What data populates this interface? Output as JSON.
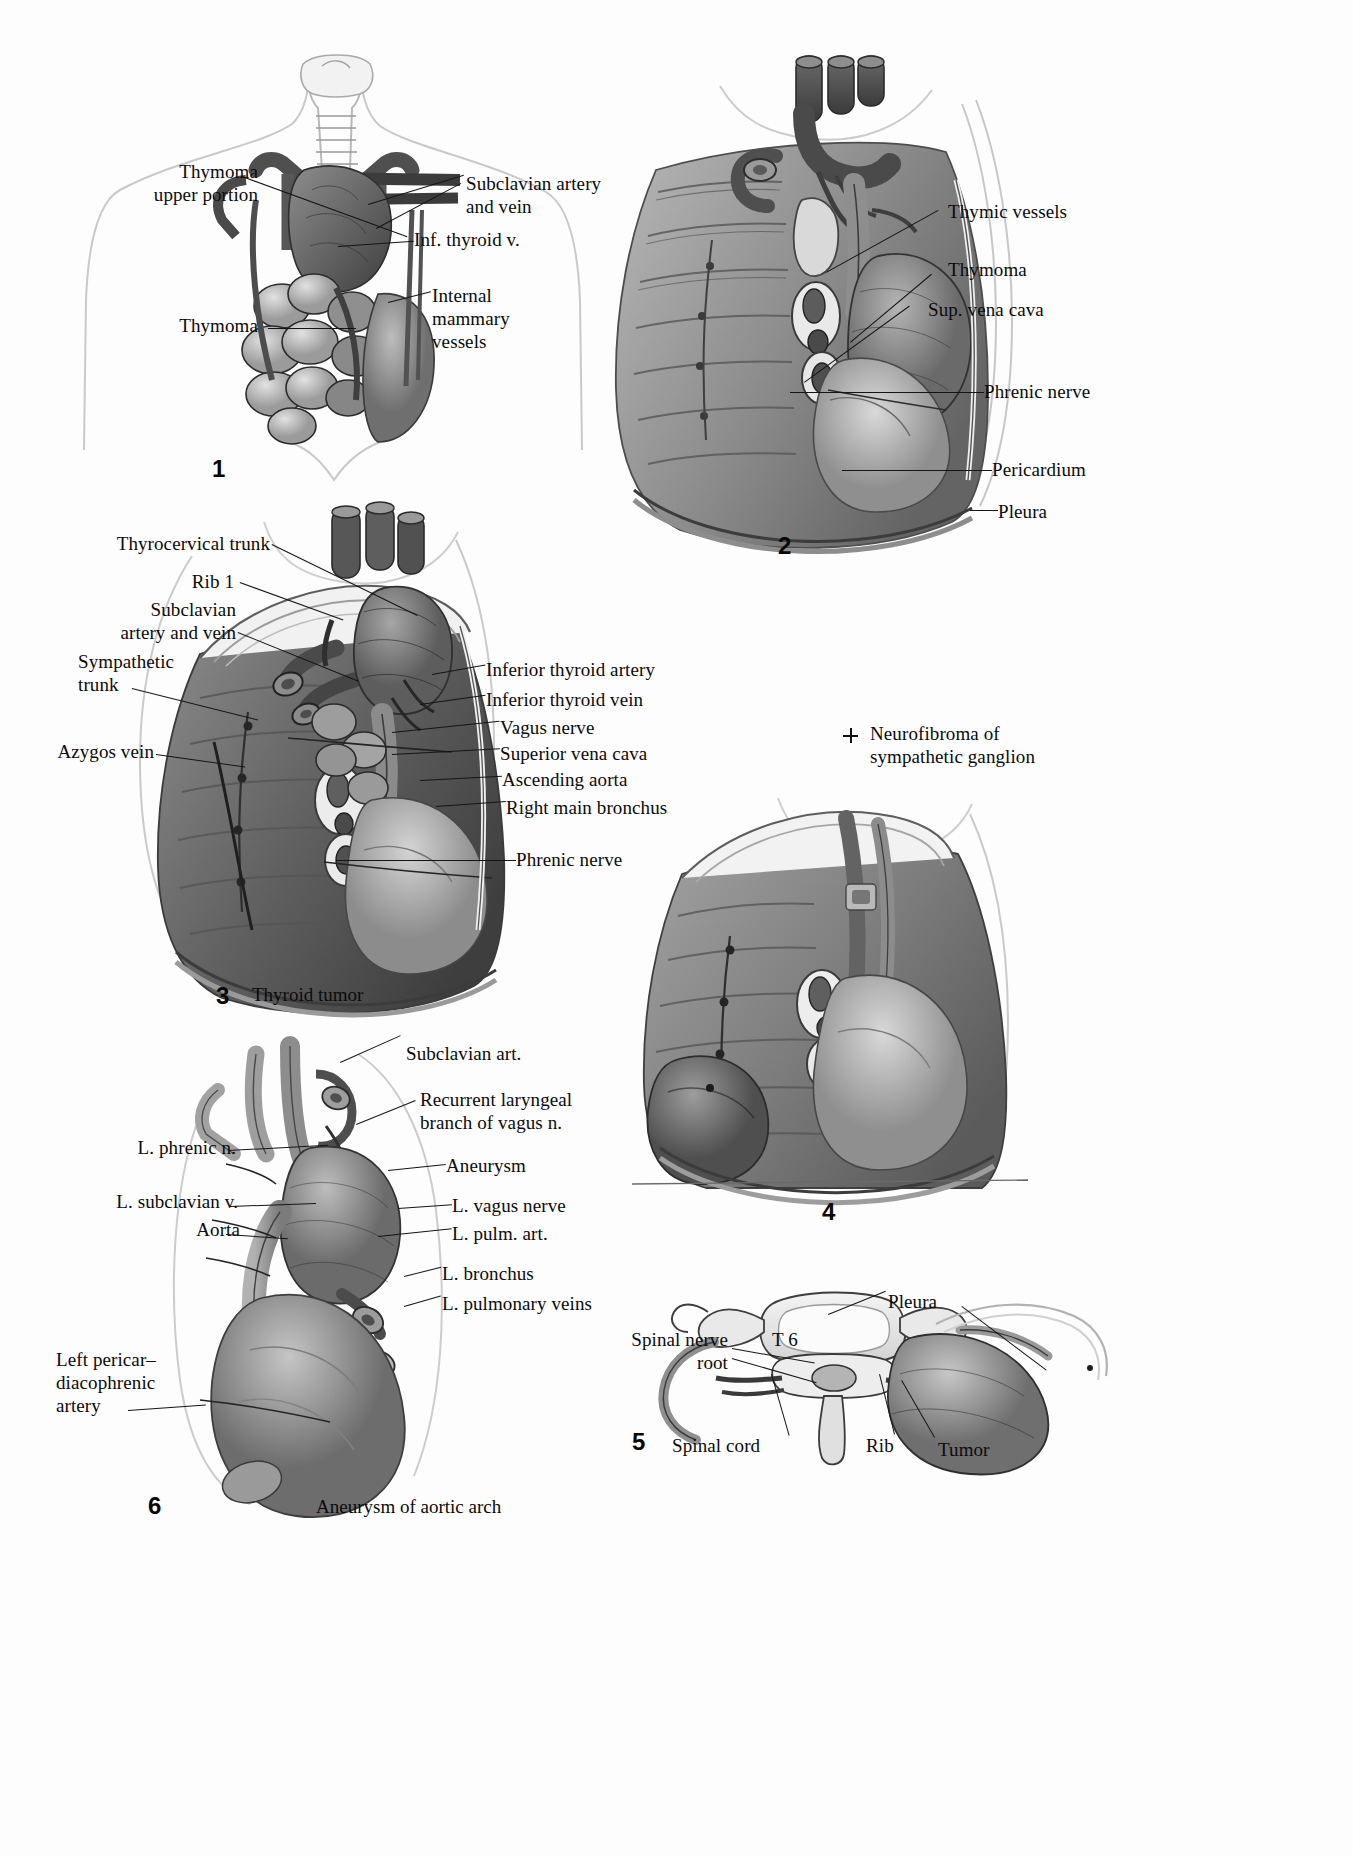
{
  "page": {
    "kind": "anatomical-plate",
    "background": "#fdfdfd",
    "ink": "#111111"
  },
  "figures": [
    {
      "id": "fig1",
      "number": "1",
      "title_caption": "",
      "labels": [
        {
          "name": "thymoma-upper-portion",
          "text": "Thymoma\nupper portion"
        },
        {
          "name": "thymoma",
          "text": "Thymoma"
        },
        {
          "name": "subclavian-artery-and-vein",
          "text": "Subclavian artery and vein"
        },
        {
          "name": "inf-thyroid-v",
          "text": "Inf. thyroid v."
        },
        {
          "name": "internal-mammary-vessels",
          "text": "Internal\nmammary\nvessels"
        }
      ]
    },
    {
      "id": "fig2",
      "number": "2",
      "title_caption": "",
      "labels": [
        {
          "name": "thymic-vessels",
          "text": "Thymic vessels"
        },
        {
          "name": "thymoma",
          "text": "Thymoma"
        },
        {
          "name": "sup-vena-cava",
          "text": "Sup. vena cava"
        },
        {
          "name": "phrenic-nerve",
          "text": "Phrenic nerve"
        },
        {
          "name": "pericardium",
          "text": "Pericardium"
        },
        {
          "name": "pleura",
          "text": "Pleura"
        }
      ]
    },
    {
      "id": "fig3",
      "number": "3",
      "title_caption": "Thyroid tumor",
      "labels": [
        {
          "name": "thyrocervical-trunk",
          "text": "Thyrocervical trunk"
        },
        {
          "name": "rib-1",
          "text": "Rib 1"
        },
        {
          "name": "subclavian-artery-and-vein",
          "text": "Subclavian\nartery and vein"
        },
        {
          "name": "sympathetic-trunk",
          "text": "Sympathetic\ntrunk"
        },
        {
          "name": "azygos-vein",
          "text": "Azygos vein"
        },
        {
          "name": "inferior-thyroid-artery",
          "text": "Inferior thyroid artery"
        },
        {
          "name": "inferior-thyroid-vein",
          "text": "Inferior thyroid vein"
        },
        {
          "name": "vagus-nerve",
          "text": "Vagus nerve"
        },
        {
          "name": "superior-vena-cava",
          "text": "Superior vena cava"
        },
        {
          "name": "ascending-aorta",
          "text": "Ascending aorta"
        },
        {
          "name": "right-main-bronchus",
          "text": "Right main bronchus"
        },
        {
          "name": "phrenic-nerve",
          "text": "Phrenic nerve"
        }
      ]
    },
    {
      "id": "fig4",
      "number": "4",
      "title_caption": "",
      "key": {
        "marker": "plus-cross-marker",
        "text": "Neurofibroma of\nsympathetic ganglion"
      },
      "labels": []
    },
    {
      "id": "fig5",
      "number": "5",
      "title_caption": "",
      "labels": [
        {
          "name": "spinal-nerve-root",
          "text": "Spinal nerve\nroot"
        },
        {
          "name": "vertebra-level",
          "text": "T 6"
        },
        {
          "name": "pleura",
          "text": "Pleura"
        },
        {
          "name": "tumor",
          "text": "Tumor"
        },
        {
          "name": "rib",
          "text": "Rib"
        },
        {
          "name": "spinal-cord",
          "text": "Spinal cord"
        }
      ]
    },
    {
      "id": "fig6",
      "number": "6",
      "title_caption": "Aneurysm of aortic arch",
      "labels": [
        {
          "name": "subclavian-art",
          "text": "Subclavian art."
        },
        {
          "name": "recurrent-laryngeal-branch-of-vagus-n",
          "text": "Recurrent laryngeal\nbranch of vagus n."
        },
        {
          "name": "l-phrenic-n",
          "text": "L. phrenic n."
        },
        {
          "name": "aneurysm",
          "text": "Aneurysm"
        },
        {
          "name": "l-subclavian-v",
          "text": "L. subclavian v."
        },
        {
          "name": "l-vagus-nerve",
          "text": "L. vagus nerve"
        },
        {
          "name": "aorta",
          "text": "Aorta"
        },
        {
          "name": "l-pulm-art",
          "text": "L. pulm. art."
        },
        {
          "name": "l-bronchus",
          "text": "L. bronchus"
        },
        {
          "name": "l-pulmonary-veins",
          "text": "L. pulmonary veins"
        },
        {
          "name": "left-pericardiacophrenic-artery",
          "text": "Left pericar–\ndiacophrenic\nartery"
        }
      ]
    }
  ]
}
